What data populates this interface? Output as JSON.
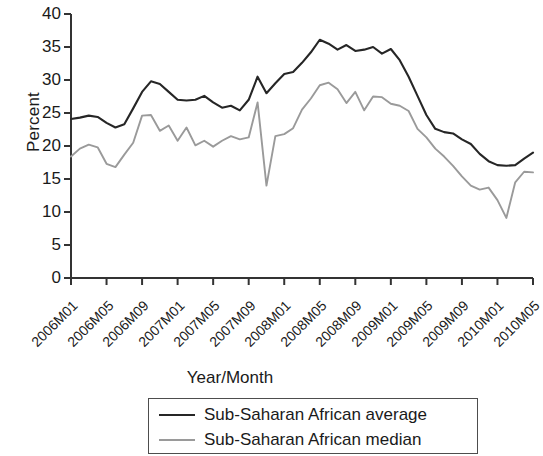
{
  "chart_data": {
    "type": "line",
    "title": "",
    "xlabel": "Year/Month",
    "ylabel": "Percent",
    "ylim": [
      0,
      40
    ],
    "yticks": [
      0,
      5,
      10,
      15,
      20,
      25,
      30,
      35,
      40
    ],
    "grid": false,
    "legend_position": "bottom",
    "x": [
      "2006M01",
      "2006M02",
      "2006M03",
      "2006M04",
      "2006M05",
      "2006M06",
      "2006M07",
      "2006M08",
      "2006M09",
      "2006M10",
      "2006M11",
      "2006M12",
      "2007M01",
      "2007M02",
      "2007M03",
      "2007M04",
      "2007M05",
      "2007M06",
      "2007M07",
      "2007M08",
      "2007M09",
      "2007M10",
      "2007M11",
      "2007M12",
      "2008M01",
      "2008M02",
      "2008M03",
      "2008M04",
      "2008M05",
      "2008M06",
      "2008M07",
      "2008M08",
      "2008M09",
      "2008M10",
      "2008M11",
      "2008M12",
      "2009M01",
      "2009M02",
      "2009M03",
      "2009M04",
      "2009M05",
      "2009M06",
      "2009M07",
      "2009M08",
      "2009M09",
      "2009M10",
      "2009M11",
      "2009M12",
      "2010M01",
      "2010M02",
      "2010M03",
      "2010M04",
      "2010M05"
    ],
    "xtick_labels": [
      "2006M01",
      "2006M05",
      "2006M09",
      "2007M01",
      "2007M05",
      "2007M09",
      "2008M01",
      "2008M05",
      "2008M09",
      "2009M01",
      "2009M05",
      "2009M09",
      "2010M01",
      "2010M05"
    ],
    "xtick_indices": [
      0,
      4,
      8,
      12,
      16,
      20,
      24,
      28,
      32,
      36,
      40,
      44,
      48,
      52
    ],
    "series": [
      {
        "name": "Sub-Saharan African average",
        "color": "#262626",
        "values": [
          24.1,
          24.3,
          24.6,
          24.4,
          23.5,
          22.8,
          23.3,
          25.7,
          28.2,
          29.8,
          29.4,
          28.2,
          27.0,
          26.9,
          27.0,
          27.6,
          26.6,
          25.8,
          26.1,
          25.4,
          27.0,
          30.5,
          28.0,
          29.5,
          30.9,
          31.2,
          32.6,
          34.2,
          36.1,
          35.5,
          34.6,
          35.3,
          34.4,
          34.6,
          35.0,
          34.0,
          34.7,
          33.0,
          30.5,
          27.6,
          24.7,
          22.6,
          22.1,
          21.9,
          21.0,
          20.3,
          18.8,
          17.7,
          17.1,
          17.0,
          17.1,
          18.1,
          19.0
        ]
      },
      {
        "name": "Sub-Saharan African median",
        "color": "#9a9a9a",
        "values": [
          18.4,
          19.6,
          20.2,
          19.8,
          17.3,
          16.8,
          18.7,
          20.5,
          24.6,
          24.7,
          22.3,
          23.1,
          20.8,
          22.8,
          20.1,
          20.8,
          19.9,
          20.8,
          21.5,
          21.0,
          21.3,
          26.6,
          14.0,
          21.5,
          21.8,
          22.7,
          25.5,
          27.2,
          29.2,
          29.6,
          28.6,
          26.5,
          28.2,
          25.4,
          27.5,
          27.4,
          26.4,
          26.1,
          25.3,
          22.6,
          21.3,
          19.6,
          18.4,
          17.0,
          15.4,
          14.0,
          13.4,
          13.7,
          11.8,
          9.1,
          14.5,
          16.1,
          16.0
        ]
      }
    ]
  },
  "axis": {
    "ylabel": "Percent",
    "xlabel": "Year/Month"
  },
  "legend": {
    "items": [
      {
        "label": "Sub-Saharan African average",
        "color": "#262626"
      },
      {
        "label": "Sub-Saharan African median",
        "color": "#9a9a9a"
      }
    ]
  }
}
